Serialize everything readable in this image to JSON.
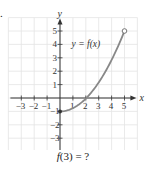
{
  "problem_mark": ".",
  "caption": {
    "func": "f",
    "arg": "(3) = ?"
  },
  "chart_data": {
    "type": "line",
    "title": "",
    "function_label": "y = f(x)",
    "xlabel": "x",
    "ylabel": "y",
    "xlim": [
      -4,
      6
    ],
    "ylim": [
      -4,
      6
    ],
    "x_ticks": [
      -3,
      -2,
      -1,
      1,
      2,
      3,
      4,
      5
    ],
    "y_ticks": [
      -3,
      -2,
      -1,
      1,
      2,
      3,
      4,
      5
    ],
    "grid": true,
    "series": [
      {
        "name": "f(x)",
        "color": "#888888",
        "points": [
          {
            "x": 0,
            "y": -1
          },
          {
            "x": 1,
            "y": -0.75
          },
          {
            "x": 2,
            "y": 0
          },
          {
            "x": 3,
            "y": 1.25
          },
          {
            "x": 4,
            "y": 3
          },
          {
            "x": 5,
            "y": 5
          }
        ],
        "start_point": {
          "x": 0,
          "y": -1,
          "style": "closed"
        },
        "end_point": {
          "x": 5,
          "y": 5,
          "style": "open"
        }
      }
    ],
    "question": "f(3) = ?"
  }
}
